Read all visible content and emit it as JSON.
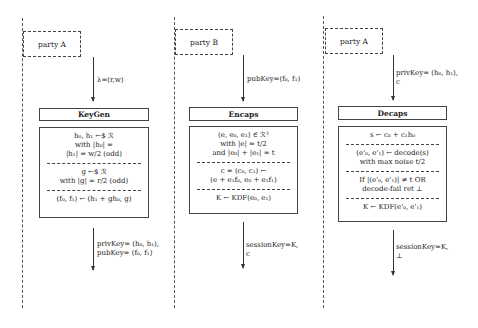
{
  "columns": [
    {
      "party": "party A",
      "incoming_label": [
        "λ=(r,w)"
      ],
      "title": "KeyGen",
      "sections": [
        [
          "h₀, h₁  ←$  ℛ",
          "with |h₀|  =",
          "|h₁|  = w/2 (odd)"
        ],
        [
          "g  ←$  ℛ",
          "with |g| ≈ r/2 (odd)"
        ],
        [
          "(f₀, f₁) ← (h₁ + gh₀, g)"
        ]
      ],
      "outgoing_label": [
        "privKey= (h₀, h₁),",
        "pubKey= (f₀, f₁)"
      ]
    },
    {
      "party": "party B",
      "incoming_label": [
        "pubKey=(f₀, f₁)"
      ],
      "title": "Encaps",
      "sections": [
        [
          "(e, e₀, e₁)  ∈  ℛ³",
          "with |e|  =  t/2",
          "and |e₀| + |e₁|  =  t"
        ],
        [
          "c  =  (c₀, c₁)  ←",
          "(e + e₁f₀, e₀ + e₁f₁)"
        ],
        [
          "K  ←  KDF(e₀, e₁)"
        ]
      ],
      "outgoing_label": [
        "sessionKey=K,",
        "c"
      ]
    },
    {
      "party": "party A",
      "incoming_label": [
        "privKey= (h₀, h₁),",
        "c"
      ],
      "title": "Decaps",
      "sections": [
        [
          "s  ←  c₀ + c₁h₀"
        ],
        [
          "(e'₀, e'₁) ← decode(s)",
          "with max noise t/2"
        ],
        [
          "If |(e'₀, e'₁)|  ≠  t OR",
          "decode-fail ret ⊥"
        ],
        [
          "K  ←  KDF(e'₀, e'₁)"
        ]
      ],
      "outgoing_label": [
        "sessionKey=K,",
        "⊥"
      ]
    }
  ]
}
